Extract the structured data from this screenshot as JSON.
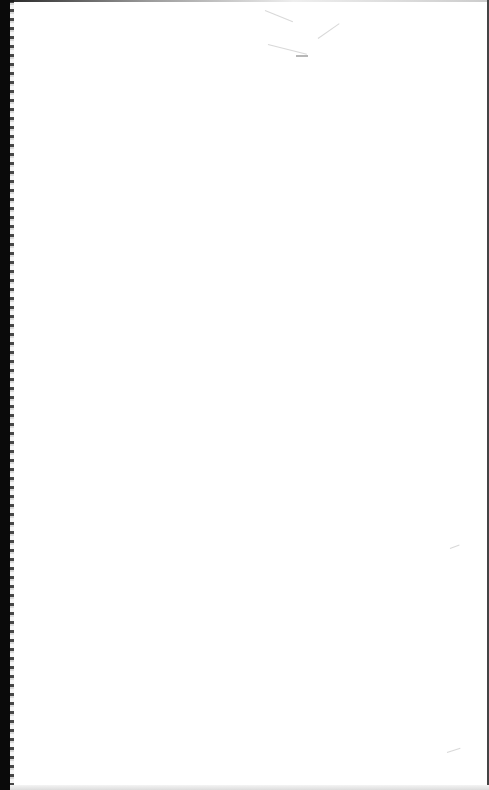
{
  "page": {
    "kind": "scanned-blank-sheet",
    "background_color": "#ffffff",
    "edge_color": "#0a0a0a",
    "text_content": []
  }
}
